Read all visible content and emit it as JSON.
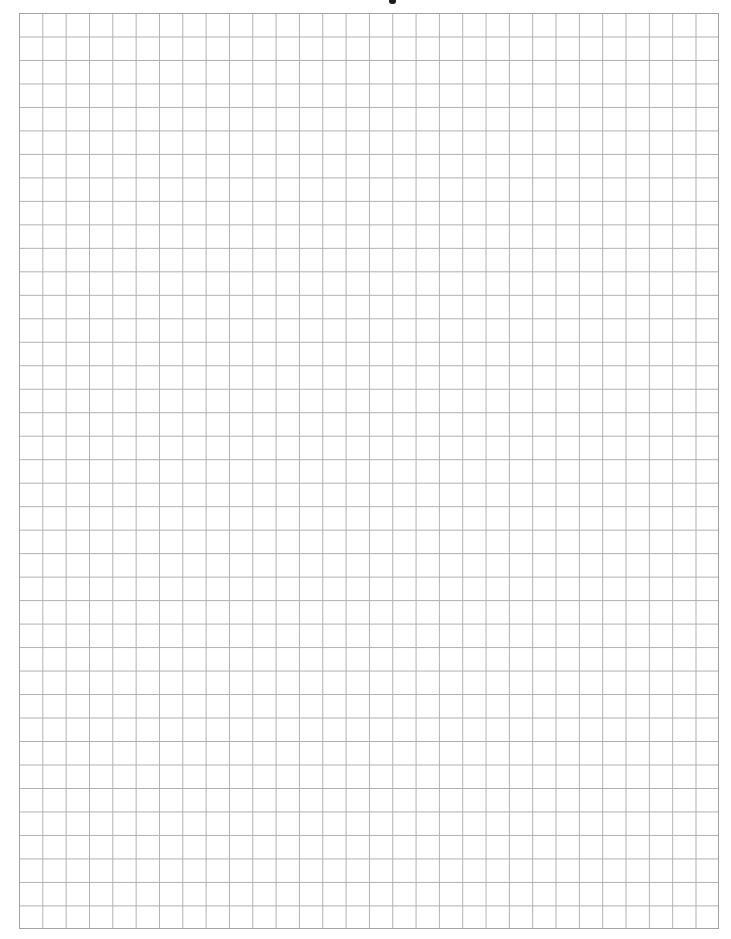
{
  "document": {
    "type": "graph-paper",
    "background_color": "#ffffff",
    "grid": {
      "columns": 30,
      "rows": 39,
      "line_color": "#b0b0b0",
      "border_color": "#a3a3a3"
    },
    "header": {
      "text": ""
    }
  }
}
